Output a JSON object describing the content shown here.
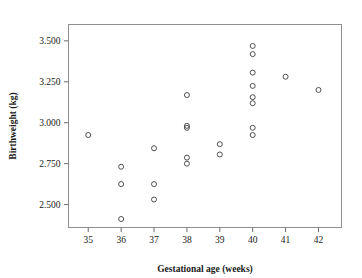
{
  "chart_data": {
    "type": "scatter",
    "title": "",
    "xlabel": "Gestational age (weeks)",
    "ylabel": "Birthweight (kg)",
    "xlim": [
      34.4,
      42.7
    ],
    "ylim": [
      2.36,
      3.6
    ],
    "xticks": [
      35,
      36,
      37,
      38,
      39,
      40,
      41,
      42
    ],
    "xtick_labels": [
      "35",
      "36",
      "37",
      "38",
      "39",
      "40",
      "41",
      "42"
    ],
    "yticks": [
      2.5,
      2.75,
      3.0,
      3.25,
      3.5
    ],
    "ytick_labels": [
      "2.500",
      "2.750",
      "3.000",
      "3.250",
      "3.500"
    ],
    "grid": false,
    "legend": null,
    "marker": "open-circle",
    "marker_color": "#3d3d3d",
    "n_points": 24,
    "x": [
      35,
      36,
      36,
      36,
      37,
      37,
      37,
      38,
      38,
      38,
      38,
      38,
      39,
      39,
      40,
      40,
      40,
      40,
      40,
      40,
      40,
      40,
      41,
      42
    ],
    "y": [
      2.925,
      2.731,
      2.625,
      2.412,
      2.844,
      2.625,
      2.531,
      3.169,
      2.981,
      2.969,
      2.787,
      2.75,
      2.869,
      2.806,
      3.469,
      3.419,
      3.306,
      3.225,
      3.156,
      3.119,
      2.969,
      2.925,
      3.281,
      3.2
    ],
    "points": [
      {
        "x": 35,
        "y": 2.925
      },
      {
        "x": 36,
        "y": 2.731
      },
      {
        "x": 36,
        "y": 2.625
      },
      {
        "x": 36,
        "y": 2.412
      },
      {
        "x": 37,
        "y": 2.844
      },
      {
        "x": 37,
        "y": 2.625
      },
      {
        "x": 37,
        "y": 2.531
      },
      {
        "x": 38,
        "y": 3.169
      },
      {
        "x": 38,
        "y": 2.981
      },
      {
        "x": 38,
        "y": 2.969
      },
      {
        "x": 38,
        "y": 2.787
      },
      {
        "x": 38,
        "y": 2.75
      },
      {
        "x": 39,
        "y": 2.869
      },
      {
        "x": 39,
        "y": 2.806
      },
      {
        "x": 40,
        "y": 3.469
      },
      {
        "x": 40,
        "y": 3.419
      },
      {
        "x": 40,
        "y": 3.306
      },
      {
        "x": 40,
        "y": 3.225
      },
      {
        "x": 40,
        "y": 3.156
      },
      {
        "x": 40,
        "y": 3.119
      },
      {
        "x": 40,
        "y": 2.969
      },
      {
        "x": 40,
        "y": 2.925
      },
      {
        "x": 41,
        "y": 3.281
      },
      {
        "x": 42,
        "y": 3.2
      }
    ]
  }
}
